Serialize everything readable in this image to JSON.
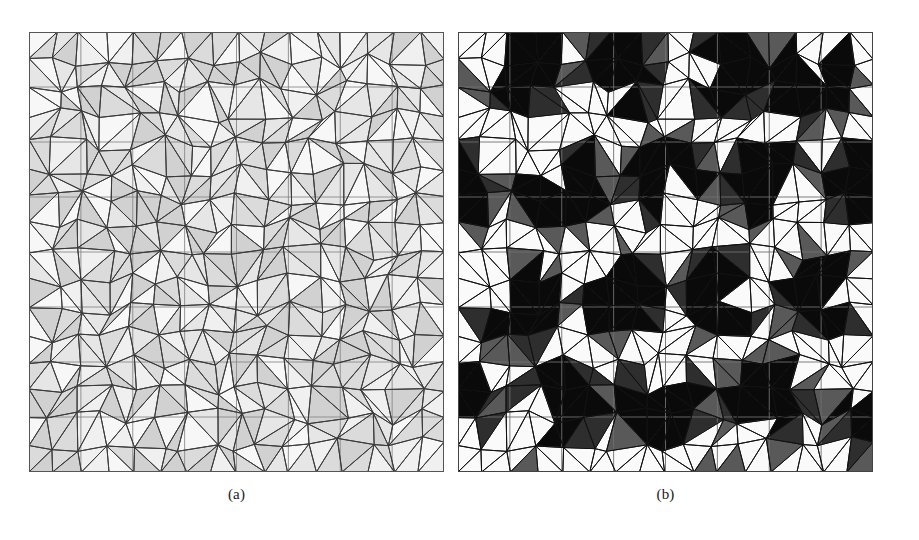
{
  "figure": {
    "background_color": "#ffffff",
    "panel_count": 2,
    "panels": [
      {
        "id": "a",
        "caption": "(a)",
        "description": "Triangulated unstructured mesh over a square domain with uniform light-gray per-triangle shading",
        "x": 29,
        "y": 32,
        "width": 415,
        "height": 440,
        "shading_mode": "low-contrast",
        "gray_min": "#cfcfcf",
        "gray_max": "#f4f4f4",
        "edge_color": "#3a3a3a",
        "grid_color": "#8a8a8a",
        "grid_divisions": 8,
        "border_color": "#555555"
      },
      {
        "id": "b",
        "caption": "(b)",
        "description": "Same triangulated mesh with high-contrast shading revealing a periodic array of dark circular inclusions each carrying a light wedge notch",
        "x": 458,
        "y": 32,
        "width": 415,
        "height": 440,
        "shading_mode": "high-contrast",
        "gray_min": "#0a0a0a",
        "gray_max": "#fafafa",
        "edge_color": "#111111",
        "grid_color": "#6f6f6f",
        "grid_divisions": 8,
        "border_color": "#444444",
        "inclusion_count": 16,
        "inclusion_radius": 52,
        "inclusion_fill": "#0d0d0d",
        "notch_fill": "#f2f2f2"
      }
    ]
  },
  "mesh": {
    "type": "triangulation",
    "grid_divisions": 8,
    "nodes_per_side": 17,
    "jitter": 0.22,
    "seed": 20240617,
    "edge_width": 1.0,
    "grid_line_width": 0.9
  },
  "chart_data": {
    "type": "table",
    "title": "",
    "panels": [
      "(a)",
      "(b)"
    ],
    "shared_mesh": true,
    "grid_divisions": 8,
    "panel_a_gray_levels": [
      0.82,
      0.86,
      0.9,
      0.94,
      0.97
    ],
    "panel_b_gray_levels": [
      0.04,
      0.18,
      0.35,
      0.55,
      0.72,
      0.88,
      0.98
    ],
    "inclusion_lattice": {
      "rows": 4,
      "cols": 4,
      "spacing_x": 104,
      "spacing_y": 110,
      "radius": 52
    }
  }
}
